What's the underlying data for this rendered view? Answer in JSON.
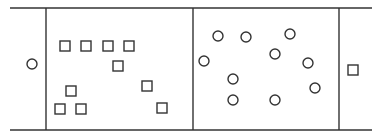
{
  "diagram": {
    "type": "membrane-transport-schematic",
    "stroke_color": "#333333",
    "background": "#ffffff",
    "frame": {
      "top_line_y": 8,
      "bottom_line_y": 130,
      "x_start": 10,
      "x_end": 372,
      "dividers_x": [
        46,
        193,
        339
      ]
    },
    "regions": [
      {
        "name": "left-outside",
        "shapes": [
          {
            "kind": "circle",
            "x": 32,
            "y": 64
          }
        ]
      },
      {
        "name": "left-compartment",
        "shapes": [
          {
            "kind": "square",
            "x": 65,
            "y": 46
          },
          {
            "kind": "square",
            "x": 86,
            "y": 46
          },
          {
            "kind": "square",
            "x": 108,
            "y": 46
          },
          {
            "kind": "square",
            "x": 129,
            "y": 46
          },
          {
            "kind": "square",
            "x": 118,
            "y": 66
          },
          {
            "kind": "square",
            "x": 71,
            "y": 91
          },
          {
            "kind": "square",
            "x": 147,
            "y": 86
          },
          {
            "kind": "square",
            "x": 60,
            "y": 109
          },
          {
            "kind": "square",
            "x": 81,
            "y": 109
          },
          {
            "kind": "square",
            "x": 162,
            "y": 108
          }
        ]
      },
      {
        "name": "right-compartment",
        "shapes": [
          {
            "kind": "circle",
            "x": 218,
            "y": 36
          },
          {
            "kind": "circle",
            "x": 246,
            "y": 37
          },
          {
            "kind": "circle",
            "x": 290,
            "y": 34
          },
          {
            "kind": "circle",
            "x": 275,
            "y": 54
          },
          {
            "kind": "circle",
            "x": 204,
            "y": 61
          },
          {
            "kind": "circle",
            "x": 308,
            "y": 63
          },
          {
            "kind": "circle",
            "x": 233,
            "y": 79
          },
          {
            "kind": "circle",
            "x": 315,
            "y": 88
          },
          {
            "kind": "circle",
            "x": 233,
            "y": 100
          },
          {
            "kind": "circle",
            "x": 275,
            "y": 100
          }
        ]
      },
      {
        "name": "right-outside",
        "shapes": [
          {
            "kind": "square",
            "x": 353,
            "y": 70
          }
        ]
      }
    ]
  }
}
